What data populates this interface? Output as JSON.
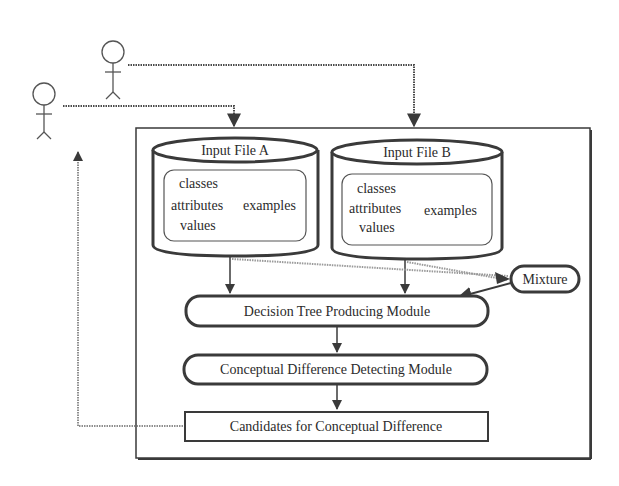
{
  "diagram": {
    "actors": [
      {
        "id": "user-1",
        "label": ""
      },
      {
        "id": "user-2",
        "label": ""
      }
    ],
    "input_files": [
      {
        "title": "Input File A",
        "left_items": [
          "classes",
          "attributes",
          "values"
        ],
        "right_item": "examples"
      },
      {
        "title": "Input File B",
        "left_items": [
          "classes",
          "attributes",
          "values"
        ],
        "right_item": "examples"
      }
    ],
    "mixture": {
      "label": "Mixture"
    },
    "modules": {
      "decision_tree": "Decision Tree Producing Module",
      "conceptual_difference": "Conceptual Difference Detecting Module",
      "candidates": "Candidates for Conceptual Difference"
    },
    "colors": {
      "stroke": "#3a3a3a",
      "dotted": "#4a4a4a",
      "light_dotted": "#9a9a9a",
      "background": "#ffffff"
    }
  }
}
